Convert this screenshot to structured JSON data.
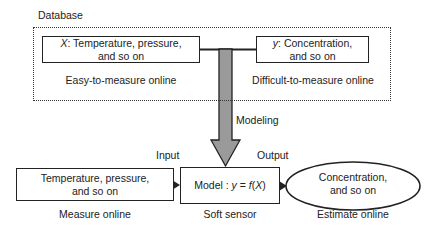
{
  "database": {
    "label": "Database",
    "x_box": {
      "var": "X",
      "line1": ": Temperature, pressure,",
      "line2": "and so on"
    },
    "x_caption": "Easy-to-measure online",
    "y_box": {
      "var": "y",
      "line1": ": Concentration,",
      "line2": "and so on"
    },
    "y_caption": "Difficult-to-measure online"
  },
  "arrow": {
    "label": "Modeling",
    "color": "#9a9a9a"
  },
  "bottom": {
    "input_label": "Input",
    "output_label": "Output",
    "input_box": {
      "line1": "Temperature, pressure,",
      "line2": "and so on"
    },
    "input_caption": "Measure online",
    "model_box": {
      "prefix": "Model : ",
      "formula_y": "y",
      "formula_eq": " = ",
      "formula_f": "f",
      "formula_open": "(",
      "formula_X": "X",
      "formula_close": ")"
    },
    "model_caption": "Soft sensor",
    "output_ellipse": {
      "line1": "Concentration,",
      "line2": "and so on"
    },
    "output_caption": "Estimate online"
  }
}
